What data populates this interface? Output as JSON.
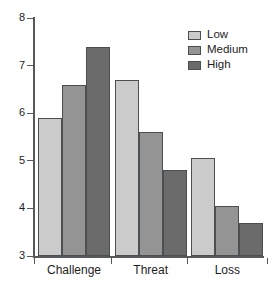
{
  "chart_data": {
    "type": "bar",
    "title": "",
    "subtitle": "",
    "xlabel": "",
    "ylabel": "",
    "categories": [
      "Challenge",
      "Threat",
      "Loss"
    ],
    "series": [
      {
        "name": "Low",
        "values": [
          5.9,
          6.7,
          5.05
        ],
        "color": "#cbcbcb"
      },
      {
        "name": "Medium",
        "values": [
          6.6,
          5.6,
          4.05
        ],
        "color": "#949494"
      },
      {
        "name": "High",
        "values": [
          7.4,
          4.8,
          3.7
        ],
        "color": "#6b6b6b"
      }
    ],
    "ylim": [
      3,
      8
    ],
    "yticks": [
      3,
      4,
      5,
      6,
      7,
      8
    ],
    "ytick_labels": [
      "3",
      "4",
      "5",
      "6",
      "7",
      "8"
    ],
    "grid": false,
    "legend_position": "top-right",
    "bar_edge_color": "#4b4f52",
    "axis_color": "#55595c",
    "text_color": "#1d1d1d"
  },
  "legend": {
    "entries": [
      {
        "label": "Low"
      },
      {
        "label": "Medium"
      },
      {
        "label": "High"
      }
    ]
  },
  "axis": {
    "y_labels": [
      "8",
      "7",
      "6",
      "5",
      "4",
      "3"
    ],
    "x_labels": [
      "Challenge",
      "Threat",
      "Loss"
    ]
  }
}
